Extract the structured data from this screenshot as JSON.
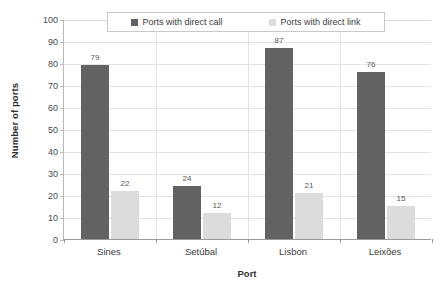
{
  "chart_data": {
    "type": "bar",
    "title": "",
    "subtitle": "",
    "xlabel": "Port",
    "ylabel": "Number of ports",
    "categories": [
      "Sines",
      "Setúbal",
      "Lisbon",
      "Leixões"
    ],
    "series": [
      {
        "name": "Ports with direct call",
        "color": "#626262",
        "values": [
          79,
          24,
          87,
          76
        ]
      },
      {
        "name": "Ports with direct link",
        "color": "#dcdcdc",
        "values": [
          22,
          12,
          21,
          15
        ]
      }
    ],
    "ylim": [
      0,
      100
    ],
    "ytick_step": 10,
    "yticks": [
      100,
      90,
      80,
      70,
      60,
      50,
      40,
      30,
      20,
      10,
      0
    ],
    "ytick_labels": [
      "100",
      "90",
      "80",
      "70",
      "60",
      "50",
      "40",
      "30",
      "20",
      "10",
      "0"
    ],
    "grid": {
      "horizontal": true,
      "vertical": true,
      "color": "#e4e4e4"
    },
    "legend": {
      "position": "top",
      "boxed": true,
      "entries": [
        "Ports with direct call",
        "Ports with direct link"
      ]
    },
    "data_labels": {
      "shown": true,
      "values": [
        [
          "79",
          "24",
          "87",
          "76"
        ],
        [
          "22",
          "12",
          "21",
          "15"
        ]
      ]
    },
    "background_color": "#ffffff",
    "axis_color": "#9a9a9a"
  }
}
